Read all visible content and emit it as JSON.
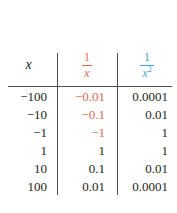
{
  "colors": {
    "negative": "#dc6852",
    "blue_header": "#3fa3d8",
    "text": "#231f20",
    "line": "#4f4f4f"
  },
  "table": {
    "headers": {
      "col1": "x",
      "col2": {
        "numerator": "1",
        "denominator": "x"
      },
      "col3": {
        "numerator": "1",
        "denominator_base": "x",
        "denominator_exponent": "2"
      }
    },
    "rows": [
      {
        "x": "−100",
        "recip": "−0.01",
        "recip_sq": "0.0001",
        "recip_negative": true
      },
      {
        "x": "−10",
        "recip": "−0.1",
        "recip_sq": "0.01",
        "recip_negative": true
      },
      {
        "x": "−1",
        "recip": "−1",
        "recip_sq": "1",
        "recip_negative": true
      },
      {
        "x": "1",
        "recip": "1",
        "recip_sq": "1",
        "recip_negative": false
      },
      {
        "x": "10",
        "recip": "0.1",
        "recip_sq": "0.01",
        "recip_negative": false
      },
      {
        "x": "100",
        "recip": "0.01",
        "recip_sq": "0.0001",
        "recip_negative": false
      }
    ]
  },
  "chart_data": {
    "type": "table",
    "title": "",
    "columns": [
      "x",
      "1/x",
      "1/x^2"
    ],
    "rows": [
      [
        -100,
        -0.01,
        0.0001
      ],
      [
        -10,
        -0.1,
        0.01
      ],
      [
        -1,
        -1,
        1
      ],
      [
        1,
        1,
        1
      ],
      [
        10,
        0.1,
        0.01
      ],
      [
        100,
        0.01,
        0.0001
      ]
    ]
  }
}
